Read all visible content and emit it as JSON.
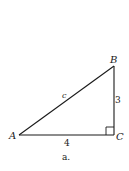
{
  "figure": {
    "caption": "a.",
    "vertices": [
      {
        "name": "A",
        "x": 19,
        "y": 135
      },
      {
        "name": "B",
        "x": 114,
        "y": 66
      },
      {
        "name": "C",
        "x": 114,
        "y": 135
      }
    ],
    "sides": {
      "hypotenuse": "c",
      "vertical": "3",
      "horizontal": "4"
    },
    "right_angle_at": "C",
    "colors": {
      "line": "#1a1a1a",
      "background": "#ffffff"
    }
  }
}
